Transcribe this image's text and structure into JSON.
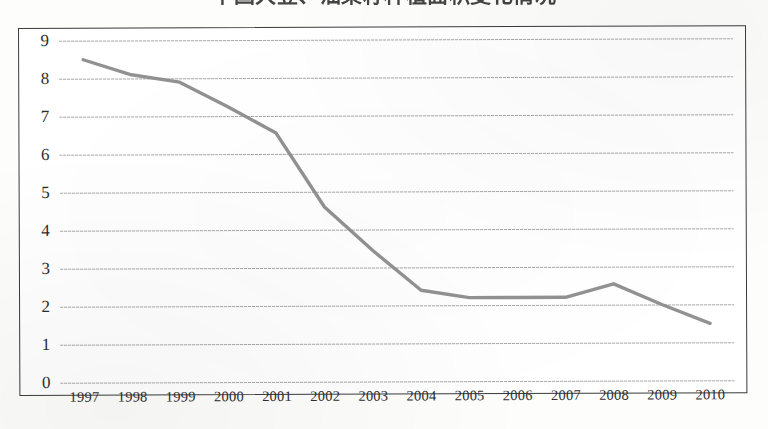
{
  "chart_data": {
    "type": "line",
    "title": "中国大豆、油菜籽种植面积变化情况",
    "xlabel": "",
    "ylabel": "",
    "categories": [
      "1997",
      "1998",
      "1999",
      "2000",
      "2001",
      "2002",
      "2003",
      "2004",
      "2005",
      "2006",
      "2007",
      "2008",
      "2009",
      "2010"
    ],
    "values": [
      8.5,
      8.1,
      7.9,
      7.25,
      6.55,
      4.6,
      3.45,
      2.4,
      2.2,
      2.2,
      2.2,
      2.55,
      2.0,
      1.5
    ],
    "series": [
      {
        "name": "series-1",
        "values": [
          8.5,
          8.1,
          7.9,
          7.25,
          6.55,
          4.6,
          3.45,
          2.4,
          2.2,
          2.2,
          2.2,
          2.55,
          2.0,
          1.5
        ]
      }
    ],
    "ylim": [
      0,
      9
    ],
    "ytick_labels": [
      "9",
      "8",
      "7",
      "6",
      "5",
      "4",
      "3",
      "2",
      "1",
      "0"
    ],
    "ytick_values": [
      9,
      8,
      7,
      6,
      5,
      4,
      3,
      2,
      1,
      0
    ],
    "ystep": 1,
    "grid": true,
    "grid_axis": "y",
    "legend": false,
    "legend_position": "none",
    "line_color": "#8c8c8c",
    "gridline_color": "#9a9a9a",
    "frame_color": "#3b3b3b",
    "text_color": "#2e2e2e"
  }
}
